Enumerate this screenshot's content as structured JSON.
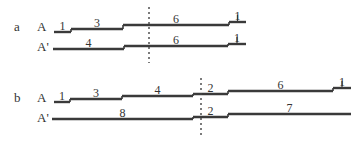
{
  "panels": [
    {
      "id": "a",
      "label": "a",
      "label_pos": [
        14,
        31
      ],
      "divider_x": 149,
      "divider_y": [
        7,
        63
      ],
      "rows": [
        {
          "name": "A",
          "label": "A",
          "label_pos": [
            37,
            31
          ],
          "segments": [
            {
              "value": "1",
              "x1": 54,
              "x2": 71,
              "y": 32
            },
            {
              "value": "3",
              "x1": 71,
              "x2": 123,
              "y": 29
            },
            {
              "value": "6",
              "x1": 123,
              "x2": 229,
              "y": 25
            },
            {
              "value": "1",
              "x1": 229,
              "x2": 246,
              "y": 22
            }
          ]
        },
        {
          "name": "A'",
          "label": "A'",
          "label_pos": [
            37,
            51
          ],
          "segments": [
            {
              "value": "4",
              "x1": 53,
              "x2": 124,
              "y": 49
            },
            {
              "value": "6",
              "x1": 124,
              "x2": 228,
              "y": 46
            },
            {
              "value": "1",
              "x1": 228,
              "x2": 246,
              "y": 44
            }
          ]
        }
      ]
    },
    {
      "id": "b",
      "label": "b",
      "label_pos": [
        14,
        102
      ],
      "divider_x": 201,
      "divider_y": [
        78,
        135
      ],
      "rows": [
        {
          "name": "A",
          "label": "A",
          "label_pos": [
            37,
            102
          ],
          "segments": [
            {
              "value": "1",
              "x1": 54,
              "x2": 70,
              "y": 102
            },
            {
              "value": "3",
              "x1": 70,
              "x2": 122,
              "y": 99
            },
            {
              "value": "4",
              "x1": 122,
              "x2": 193,
              "y": 96
            },
            {
              "value": "2",
              "x1": 193,
              "x2": 228,
              "y": 94
            },
            {
              "value": "6",
              "x1": 228,
              "x2": 333,
              "y": 91
            },
            {
              "value": "1",
              "x1": 333,
              "x2": 351,
              "y": 88
            }
          ]
        },
        {
          "name": "A'",
          "label": "A'",
          "label_pos": [
            37,
            122
          ],
          "segments": [
            {
              "value": "8",
              "x1": 52,
              "x2": 193,
              "y": 119
            },
            {
              "value": "2",
              "x1": 193,
              "x2": 228,
              "y": 117
            },
            {
              "value": "7",
              "x1": 228,
              "x2": 351,
              "y": 114
            }
          ]
        }
      ]
    }
  ],
  "style": {
    "line_color": "#3a3a3a",
    "text_color": "#333333",
    "divider_color": "#444444"
  }
}
